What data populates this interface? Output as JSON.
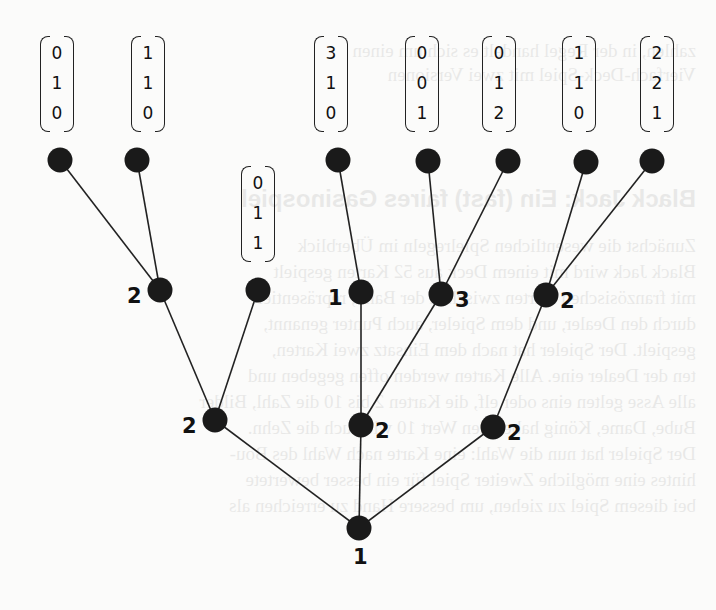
{
  "diagram": {
    "type": "game-tree",
    "node_color": "#1a1a1a",
    "edge_color": "#222222",
    "nodes": [
      {
        "id": "root",
        "x": 359,
        "y": 528,
        "label": "1",
        "label_pos": "below"
      },
      {
        "id": "n1",
        "x": 215,
        "y": 420,
        "label": "2",
        "label_pos": "left"
      },
      {
        "id": "n2",
        "x": 361,
        "y": 425,
        "label": "2",
        "label_pos": "right"
      },
      {
        "id": "n3",
        "x": 493,
        "y": 427,
        "label": "2",
        "label_pos": "right"
      },
      {
        "id": "n11",
        "x": 160,
        "y": 290,
        "label": "2",
        "label_pos": "left"
      },
      {
        "id": "n12",
        "x": 258,
        "y": 290,
        "label": "",
        "label_pos": "none"
      },
      {
        "id": "n21",
        "x": 361,
        "y": 292,
        "label": "1",
        "label_pos": "left"
      },
      {
        "id": "n22",
        "x": 441,
        "y": 294,
        "label": "3",
        "label_pos": "right"
      },
      {
        "id": "n31",
        "x": 546,
        "y": 295,
        "label": "2",
        "label_pos": "right"
      },
      {
        "id": "l1",
        "x": 60,
        "y": 160,
        "label": "",
        "label_pos": "none"
      },
      {
        "id": "l2",
        "x": 137,
        "y": 160,
        "label": "",
        "label_pos": "none"
      },
      {
        "id": "l3",
        "x": 338,
        "y": 160,
        "label": "",
        "label_pos": "none"
      },
      {
        "id": "l4",
        "x": 428,
        "y": 161,
        "label": "",
        "label_pos": "none"
      },
      {
        "id": "l5",
        "x": 508,
        "y": 161,
        "label": "",
        "label_pos": "none"
      },
      {
        "id": "l6",
        "x": 586,
        "y": 162,
        "label": "",
        "label_pos": "none"
      },
      {
        "id": "l7",
        "x": 652,
        "y": 161,
        "label": "",
        "label_pos": "none"
      }
    ],
    "edges": [
      [
        "root",
        "n1"
      ],
      [
        "root",
        "n2"
      ],
      [
        "root",
        "n3"
      ],
      [
        "n1",
        "n11"
      ],
      [
        "n1",
        "n12"
      ],
      [
        "n2",
        "n21"
      ],
      [
        "n2",
        "n22"
      ],
      [
        "n3",
        "n31"
      ],
      [
        "n11",
        "l1"
      ],
      [
        "n11",
        "l2"
      ],
      [
        "n21",
        "l3"
      ],
      [
        "n22",
        "l4"
      ],
      [
        "n22",
        "l5"
      ],
      [
        "n31",
        "l6"
      ],
      [
        "n31",
        "l7"
      ]
    ],
    "payoff_vectors": [
      {
        "leaf": "l1",
        "x": 40,
        "y": 36,
        "values": [
          "0",
          "1",
          "0"
        ]
      },
      {
        "leaf": "l2",
        "x": 131,
        "y": 36,
        "values": [
          "1",
          "1",
          "0"
        ]
      },
      {
        "leaf": "n12",
        "x": 241,
        "y": 166,
        "values": [
          "0",
          "1",
          "1"
        ]
      },
      {
        "leaf": "l3",
        "x": 314,
        "y": 36,
        "values": [
          "3",
          "1",
          "0"
        ]
      },
      {
        "leaf": "l4",
        "x": 405,
        "y": 36,
        "values": [
          "0",
          "0",
          "1"
        ]
      },
      {
        "leaf": "l5",
        "x": 482,
        "y": 36,
        "values": [
          "0",
          "1",
          "2"
        ]
      },
      {
        "leaf": "l6",
        "x": 562,
        "y": 36,
        "values": [
          "1",
          "1",
          "0"
        ]
      },
      {
        "leaf": "l7",
        "x": 640,
        "y": 36,
        "values": [
          "2",
          "2",
          "1"
        ]
      }
    ]
  }
}
